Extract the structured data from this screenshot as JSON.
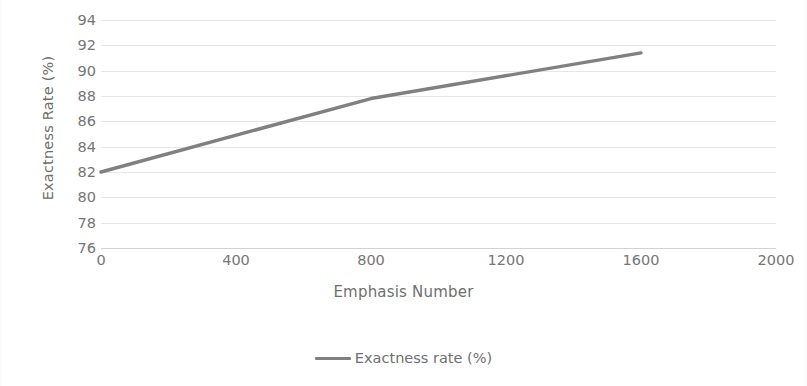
{
  "chart_data": {
    "type": "line",
    "title": "",
    "xlabel": "Emphasis Number",
    "ylabel": "Exactness Rate (%)",
    "xlim": [
      0,
      2000
    ],
    "ylim": [
      76,
      94
    ],
    "x_ticks": [
      0,
      400,
      800,
      1200,
      1600,
      2000
    ],
    "y_ticks": [
      76,
      78,
      80,
      82,
      84,
      86,
      88,
      90,
      92,
      94
    ],
    "grid": true,
    "legend_position": "bottom",
    "series": [
      {
        "name": "Exactness rate (%)",
        "color": "#808080",
        "x": [
          0,
          800,
          1600
        ],
        "values": [
          82.0,
          87.8,
          91.4
        ]
      }
    ]
  },
  "axes": {
    "y_title": "Exactness Rate (%)",
    "x_title": "Emphasis Number",
    "y_tick_labels": [
      "94",
      "92",
      "90",
      "88",
      "86",
      "84",
      "82",
      "80",
      "78",
      "76"
    ],
    "x_tick_labels": [
      "0",
      "400",
      "800",
      "1200",
      "1600",
      "2000"
    ]
  },
  "legend": {
    "entries": [
      {
        "label": "Exactness rate (%)",
        "color": "#808080"
      }
    ]
  },
  "colors": {
    "series_line": "#808080",
    "gridline": "#e6e6e6",
    "axis_text": "#767676",
    "title_text": "#6f6f6f",
    "background": "#ffffff"
  }
}
